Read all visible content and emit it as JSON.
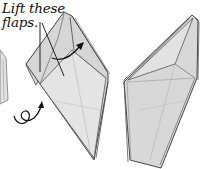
{
  "diagram": {
    "instruction": {
      "line1": "Lift these",
      "line2": "flaps."
    },
    "symbols": {
      "turn_over": "turn-over-loop-arrow",
      "lift_arrow": "curved-lift-arrow"
    },
    "colors": {
      "paper": "#d9d9d9",
      "paper_light": "#e6e6e6",
      "edge": "#4a4a4a",
      "text": "#111111"
    }
  }
}
